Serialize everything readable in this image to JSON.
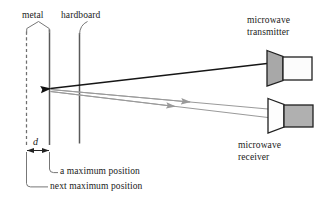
{
  "diagram": {
    "labels": {
      "metal": "metal",
      "hardboard": "hardboard",
      "transmitter_line1": "microwave",
      "transmitter_line2": "transmitter",
      "receiver_line1": "microwave",
      "receiver_line2": "receiver",
      "distance": "d",
      "a_maximum": "a maximum position",
      "next_maximum": "next maximum position"
    },
    "colors": {
      "background": "#ffffff",
      "line_dark": "#1a1a1a",
      "line_gray": "#8c8c8c",
      "line_mid": "#555555",
      "horn_gray": "#a8a8a8",
      "body_gray": "#b0b0b0",
      "body_white": "#fbfbfb",
      "text": "#1a1a1a"
    },
    "elements": {
      "metal_plate": "dashed vertical line at next maximum position",
      "metal_plate_solid": "solid vertical line at a maximum position",
      "hardboard_plate": "solid vertical line",
      "incident_ray": "dark ray from transmitter to plate with left arrowhead",
      "reflected_ray_1": "gray ray from plate to receiver with right arrowhead",
      "reflected_ray_2": "gray ray from plate to receiver with right arrowhead",
      "transmitter_horn": "gray trapezoid horn",
      "transmitter_body": "white rectangle body",
      "receiver_horn": "white trapezoid horn",
      "receiver_body": "gray rectangle body",
      "distance_arrow": "double headed horizontal arrow labelled d"
    }
  }
}
